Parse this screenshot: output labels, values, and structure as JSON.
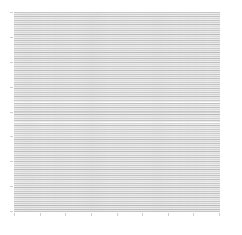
{
  "figure": {
    "title": "",
    "background_color": "#ffffff",
    "width_px": 242,
    "height_px": 235
  },
  "axes": {
    "left_px": 14,
    "top_px": 12,
    "width_px": 206,
    "height_px": 200,
    "facecolor": "#ffffff",
    "grid": false,
    "xlabel": "",
    "ylabel": "",
    "xtick_labels": [],
    "ytick_labels": [],
    "xtick_count": 9,
    "ytick_count": 9,
    "tick_color": "#cfcfcf",
    "spine_color": "#f0f0f0"
  },
  "colors": {
    "line_dark": "#b9b9b9",
    "line_mid": "#cccccc",
    "line_light": "#dedede",
    "gap": "#ffffff",
    "background": "#ffffff"
  },
  "chart_data": {
    "type": "line",
    "title": "",
    "subtitle": "",
    "xlabel": "",
    "ylabel": "",
    "xlim": [
      0,
      1
    ],
    "ylim": [
      0,
      1
    ],
    "grid": false,
    "legend": null,
    "legend_position": "none",
    "orientation": "horizontal",
    "line_count": 100,
    "x": [
      0,
      1
    ],
    "series": [
      {
        "name": "row-0",
        "values": [
          0.0,
          0.0
        ],
        "color": "#c4c4c4",
        "linewidth": 1.0
      },
      {
        "name": "row-1",
        "values": [
          0.01,
          0.01
        ],
        "color": "#bdbdbd",
        "linewidth": 1.0
      },
      {
        "name": "row-2",
        "values": [
          0.02,
          0.02
        ],
        "color": "#d2d2d2",
        "linewidth": 1.0
      },
      {
        "name": "row-3",
        "values": [
          0.03,
          0.03
        ],
        "color": "#b9b9b9",
        "linewidth": 1.0
      },
      {
        "name": "row-4",
        "values": [
          0.04,
          0.04
        ],
        "color": "#cfcfcf",
        "linewidth": 1.0
      },
      {
        "name": "row-5",
        "values": [
          0.051,
          0.051
        ],
        "color": "#c8c8c8",
        "linewidth": 1.0
      },
      {
        "name": "row-6",
        "values": [
          0.061,
          0.061
        ],
        "color": "#dcdcdc",
        "linewidth": 1.0
      },
      {
        "name": "row-7",
        "values": [
          0.071,
          0.071
        ],
        "color": "#bcbcbc",
        "linewidth": 1.0
      },
      {
        "name": "row-8",
        "values": [
          0.081,
          0.081
        ],
        "color": "#d6d6d6",
        "linewidth": 1.0
      },
      {
        "name": "row-9",
        "values": [
          0.091,
          0.091
        ],
        "color": "#c1c1c1",
        "linewidth": 1.0
      },
      {
        "name": "row-10",
        "values": [
          0.101,
          0.101
        ],
        "color": "#cacaca",
        "linewidth": 1.0
      },
      {
        "name": "row-11",
        "values": [
          0.111,
          0.111
        ],
        "color": "#dadada",
        "linewidth": 1.0
      },
      {
        "name": "row-12",
        "values": [
          0.121,
          0.121
        ],
        "color": "#bababa",
        "linewidth": 1.0
      },
      {
        "name": "row-13",
        "values": [
          0.131,
          0.131
        ],
        "color": "#d0d0d0",
        "linewidth": 1.0
      },
      {
        "name": "row-14",
        "values": [
          0.141,
          0.141
        ],
        "color": "#c6c6c6",
        "linewidth": 1.0
      },
      {
        "name": "row-15",
        "values": [
          0.152,
          0.152
        ],
        "color": "#dedede",
        "linewidth": 1.0
      },
      {
        "name": "row-16",
        "values": [
          0.162,
          0.162
        ],
        "color": "#bfbfbf",
        "linewidth": 1.0
      },
      {
        "name": "row-17",
        "values": [
          0.172,
          0.172
        ],
        "color": "#d4d4d4",
        "linewidth": 1.0
      },
      {
        "name": "row-18",
        "values": [
          0.182,
          0.182
        ],
        "color": "#c3c3c3",
        "linewidth": 1.0
      },
      {
        "name": "row-19",
        "values": [
          0.192,
          0.192
        ],
        "color": "#cdcdcd",
        "linewidth": 1.0
      },
      {
        "name": "row-20",
        "values": [
          0.202,
          0.202
        ],
        "color": "#d8d8d8",
        "linewidth": 1.0
      },
      {
        "name": "row-21",
        "values": [
          0.212,
          0.212
        ],
        "color": "#b9b9b9",
        "linewidth": 1.0
      },
      {
        "name": "row-22",
        "values": [
          0.222,
          0.222
        ],
        "color": "#d1d1d1",
        "linewidth": 1.0
      },
      {
        "name": "row-23",
        "values": [
          0.232,
          0.232
        ],
        "color": "#c7c7c7",
        "linewidth": 1.0
      },
      {
        "name": "row-24",
        "values": [
          0.242,
          0.242
        ],
        "color": "#dbdbdb",
        "linewidth": 1.0
      },
      {
        "name": "row-25",
        "values": [
          0.253,
          0.253
        ],
        "color": "#bebebe",
        "linewidth": 1.0
      },
      {
        "name": "row-26",
        "values": [
          0.263,
          0.263
        ],
        "color": "#d5d5d5",
        "linewidth": 1.0
      },
      {
        "name": "row-27",
        "values": [
          0.273,
          0.273
        ],
        "color": "#c2c2c2",
        "linewidth": 1.0
      },
      {
        "name": "row-28",
        "values": [
          0.283,
          0.283
        ],
        "color": "#cbcbcb",
        "linewidth": 1.0
      },
      {
        "name": "row-29",
        "values": [
          0.293,
          0.293
        ],
        "color": "#dddddd",
        "linewidth": 1.0
      },
      {
        "name": "row-30",
        "values": [
          0.303,
          0.303
        ],
        "color": "#bbbbbb",
        "linewidth": 1.0
      },
      {
        "name": "row-31",
        "values": [
          0.313,
          0.313
        ],
        "color": "#cfcfcf",
        "linewidth": 1.0
      },
      {
        "name": "row-32",
        "values": [
          0.323,
          0.323
        ],
        "color": "#c5c5c5",
        "linewidth": 1.0
      },
      {
        "name": "row-33",
        "values": [
          0.333,
          0.333
        ],
        "color": "#d9d9d9",
        "linewidth": 1.0
      },
      {
        "name": "row-34",
        "values": [
          0.343,
          0.343
        ],
        "color": "#c0c0c0",
        "linewidth": 1.0
      },
      {
        "name": "row-35",
        "values": [
          0.354,
          0.354
        ],
        "color": "#d3d3d3",
        "linewidth": 1.0
      },
      {
        "name": "row-36",
        "values": [
          0.364,
          0.364
        ],
        "color": "#bdbdbd",
        "linewidth": 1.0
      },
      {
        "name": "row-37",
        "values": [
          0.374,
          0.374
        ],
        "color": "#cecece",
        "linewidth": 1.0
      },
      {
        "name": "row-38",
        "values": [
          0.384,
          0.384
        ],
        "color": "#d7d7d7",
        "linewidth": 1.0
      },
      {
        "name": "row-39",
        "values": [
          0.394,
          0.394
        ],
        "color": "#babababa",
        "linewidth": 1.0
      },
      {
        "name": "row-40",
        "values": [
          0.404,
          0.404
        ],
        "color": "#d0d0d0",
        "linewidth": 1.0
      },
      {
        "name": "row-41",
        "values": [
          0.414,
          0.414
        ],
        "color": "#c9c9c9",
        "linewidth": 1.0
      },
      {
        "name": "row-42",
        "values": [
          0.424,
          0.424
        ],
        "color": "#dcdcdc",
        "linewidth": 1.0
      },
      {
        "name": "row-43",
        "values": [
          0.434,
          0.434
        ],
        "color": "#bcbcbc",
        "linewidth": 1.0
      },
      {
        "name": "row-44",
        "values": [
          0.444,
          0.444
        ],
        "color": "#d4d4d4",
        "linewidth": 1.0
      },
      {
        "name": "row-45",
        "values": [
          0.455,
          0.455
        ],
        "color": "#c4c4c4",
        "linewidth": 1.0
      },
      {
        "name": "row-46",
        "values": [
          0.465,
          0.465
        ],
        "color": "#cccccc",
        "linewidth": 1.0
      },
      {
        "name": "row-47",
        "values": [
          0.475,
          0.475
        ],
        "color": "#dedede",
        "linewidth": 1.0
      },
      {
        "name": "row-48",
        "values": [
          0.485,
          0.485
        ],
        "color": "#b9b9b9",
        "linewidth": 1.0
      },
      {
        "name": "row-49",
        "values": [
          0.495,
          0.495
        ],
        "color": "#d2d2d2",
        "linewidth": 1.0
      },
      {
        "name": "row-50",
        "values": [
          0.505,
          0.505
        ],
        "color": "#c6c6c6",
        "linewidth": 1.0
      },
      {
        "name": "row-51",
        "values": [
          0.515,
          0.515
        ],
        "color": "#dadada",
        "linewidth": 1.0
      },
      {
        "name": "row-52",
        "values": [
          0.525,
          0.525
        ],
        "color": "#bfbfbf",
        "linewidth": 1.0
      },
      {
        "name": "row-53",
        "values": [
          0.535,
          0.535
        ],
        "color": "#d6d6d6",
        "linewidth": 1.0
      },
      {
        "name": "row-54",
        "values": [
          0.545,
          0.545
        ],
        "color": "#c1c1c1",
        "linewidth": 1.0
      },
      {
        "name": "row-55",
        "values": [
          0.556,
          0.556
        ],
        "color": "#cacaca",
        "linewidth": 1.0
      },
      {
        "name": "row-56",
        "values": [
          0.566,
          0.566
        ],
        "color": "#dddddd",
        "linewidth": 1.0
      },
      {
        "name": "row-57",
        "values": [
          0.576,
          0.576
        ],
        "color": "#bababa",
        "linewidth": 1.0
      },
      {
        "name": "row-58",
        "values": [
          0.586,
          0.586
        ],
        "color": "#d1d1d1",
        "linewidth": 1.0
      },
      {
        "name": "row-59",
        "values": [
          0.596,
          0.596
        ],
        "color": "#c8c8c8",
        "linewidth": 1.0
      },
      {
        "name": "row-60",
        "values": [
          0.606,
          0.606
        ],
        "color": "#d8d8d8",
        "linewidth": 1.0
      },
      {
        "name": "row-61",
        "values": [
          0.616,
          0.616
        ],
        "color": "#bdbdbd",
        "linewidth": 1.0
      },
      {
        "name": "row-62",
        "values": [
          0.626,
          0.626
        ],
        "color": "#d5d5d5",
        "linewidth": 1.0
      },
      {
        "name": "row-63",
        "values": [
          0.636,
          0.636
        ],
        "color": "#c3c3c3",
        "linewidth": 1.0
      },
      {
        "name": "row-64",
        "values": [
          0.646,
          0.646
        ],
        "color": "#cdcdcd",
        "linewidth": 1.0
      },
      {
        "name": "row-65",
        "values": [
          0.657,
          0.657
        ],
        "color": "#dbdbdb",
        "linewidth": 1.0
      },
      {
        "name": "row-66",
        "values": [
          0.667,
          0.667
        ],
        "color": "#bebebe",
        "linewidth": 1.0
      },
      {
        "name": "row-67",
        "values": [
          0.677,
          0.677
        ],
        "color": "#cfcfcf",
        "linewidth": 1.0
      },
      {
        "name": "row-68",
        "values": [
          0.687,
          0.687
        ],
        "color": "#c5c5c5",
        "linewidth": 1.0
      },
      {
        "name": "row-69",
        "values": [
          0.697,
          0.697
        ],
        "color": "#d9d9d9",
        "linewidth": 1.0
      },
      {
        "name": "row-70",
        "values": [
          0.707,
          0.707
        ],
        "color": "#bbbbbb",
        "linewidth": 1.0
      },
      {
        "name": "row-71",
        "values": [
          0.717,
          0.717
        ],
        "color": "#d3d3d3",
        "linewidth": 1.0
      },
      {
        "name": "row-72",
        "values": [
          0.727,
          0.727
        ],
        "color": "#c7c7c7",
        "linewidth": 1.0
      },
      {
        "name": "row-73",
        "values": [
          0.737,
          0.737
        ],
        "color": "#dcdcdc",
        "linewidth": 1.0
      },
      {
        "name": "row-74",
        "values": [
          0.747,
          0.747
        ],
        "color": "#c0c0c0",
        "linewidth": 1.0
      },
      {
        "name": "row-75",
        "values": [
          0.758,
          0.758
        ],
        "color": "#d4d4d4",
        "linewidth": 1.0
      },
      {
        "name": "row-76",
        "values": [
          0.768,
          0.768
        ],
        "color": "#bcbcbc",
        "linewidth": 1.0
      },
      {
        "name": "row-77",
        "values": [
          0.778,
          0.778
        ],
        "color": "#cbcbcb",
        "linewidth": 1.0
      },
      {
        "name": "row-78",
        "values": [
          0.788,
          0.788
        ],
        "color": "#d7d7d7",
        "linewidth": 1.0
      },
      {
        "name": "row-79",
        "values": [
          0.798,
          0.798
        ],
        "color": "#b9b9b9",
        "linewidth": 1.0
      },
      {
        "name": "row-80",
        "values": [
          0.808,
          0.808
        ],
        "color": "#d0d0d0",
        "linewidth": 1.0
      },
      {
        "name": "row-81",
        "values": [
          0.818,
          0.818
        ],
        "color": "#c9c9c9",
        "linewidth": 1.0
      },
      {
        "name": "row-82",
        "values": [
          0.828,
          0.828
        ],
        "color": "#dedede",
        "linewidth": 1.0
      },
      {
        "name": "row-83",
        "values": [
          0.838,
          0.838
        ],
        "color": "#bfbfbf",
        "linewidth": 1.0
      },
      {
        "name": "row-84",
        "values": [
          0.848,
          0.848
        ],
        "color": "#d2d2d2",
        "linewidth": 1.0
      },
      {
        "name": "row-85",
        "values": [
          0.859,
          0.859
        ],
        "color": "#c2c2c2",
        "linewidth": 1.0
      },
      {
        "name": "row-86",
        "values": [
          0.869,
          0.869
        ],
        "color": "#cccccc",
        "linewidth": 1.0
      },
      {
        "name": "row-87",
        "values": [
          0.879,
          0.879
        ],
        "color": "#dadada",
        "linewidth": 1.0
      },
      {
        "name": "row-88",
        "values": [
          0.889,
          0.889
        ],
        "color": "#bababa",
        "linewidth": 1.0
      },
      {
        "name": "row-89",
        "values": [
          0.899,
          0.899
        ],
        "color": "#d6d6d6",
        "linewidth": 1.0
      },
      {
        "name": "row-90",
        "values": [
          0.909,
          0.909
        ],
        "color": "#c6c6c6",
        "linewidth": 1.0
      },
      {
        "name": "row-91",
        "values": [
          0.919,
          0.919
        ],
        "color": "#cecece",
        "linewidth": 1.0
      },
      {
        "name": "row-92",
        "values": [
          0.929,
          0.929
        ],
        "color": "#dddddd",
        "linewidth": 1.0
      },
      {
        "name": "row-93",
        "values": [
          0.939,
          0.939
        ],
        "color": "#bdbdbd",
        "linewidth": 1.0
      },
      {
        "name": "row-94",
        "values": [
          0.949,
          0.949
        ],
        "color": "#d1d1d1",
        "linewidth": 1.0
      },
      {
        "name": "row-95",
        "values": [
          0.96,
          0.96
        ],
        "color": "#c4c4c4",
        "linewidth": 1.0
      },
      {
        "name": "row-96",
        "values": [
          0.97,
          0.97
        ],
        "color": "#d8d8d8",
        "linewidth": 1.0
      },
      {
        "name": "row-97",
        "values": [
          0.98,
          0.98
        ],
        "color": "#c1c1c1",
        "linewidth": 1.0
      },
      {
        "name": "row-98",
        "values": [
          0.99,
          0.99
        ],
        "color": "#cfcfcf",
        "linewidth": 1.0
      },
      {
        "name": "row-99",
        "values": [
          1.0,
          1.0
        ],
        "color": "#c8c8c8",
        "linewidth": 1.0
      }
    ]
  }
}
